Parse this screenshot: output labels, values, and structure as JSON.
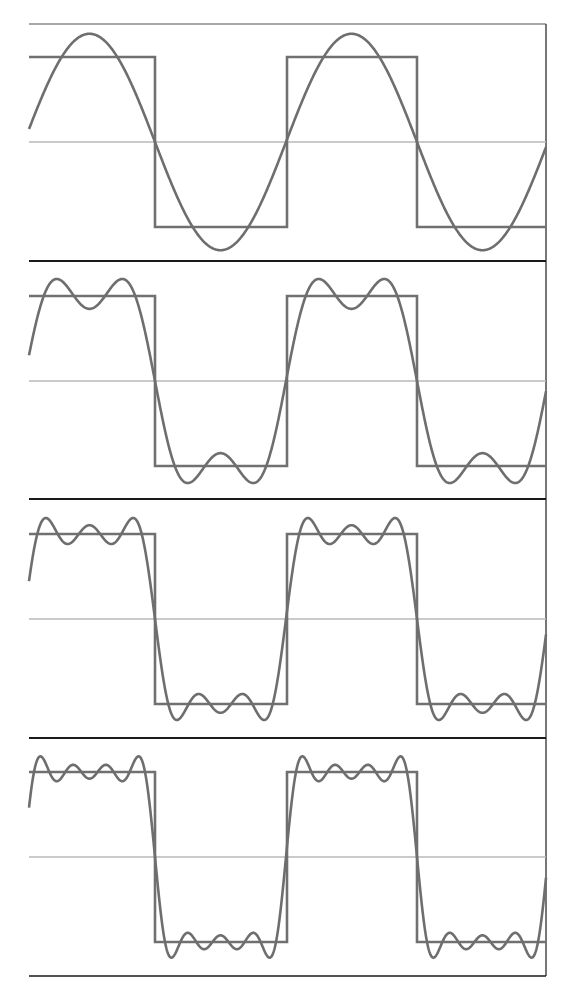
{
  "chart_data": {
    "type": "line",
    "title": "",
    "xlabel": "",
    "ylabel": "",
    "grid": false,
    "legend": null,
    "colors": {
      "square": "#707070",
      "approximation": "#6e6e6e",
      "midline": "#b8b8b8",
      "divider": "#1a1a1a",
      "frame": "#4a4a4a"
    },
    "layout": {
      "plot_left_px": 29,
      "plot_right_px": 546,
      "top_px": 24,
      "bottom_px": 976,
      "half_period_px": 131,
      "rising_zero_crossing_px": 24,
      "square_edges_px": [
        155,
        287,
        417
      ],
      "panel_bounds_px": [
        [
          24,
          261
        ],
        [
          261,
          499
        ],
        [
          499,
          738
        ],
        [
          738,
          976
        ]
      ],
      "panel_midlines_px": [
        142,
        381,
        619,
        857
      ],
      "square_half_height_px": 85
    },
    "x_range_periods": [
      0.0,
      1.97
    ],
    "y_range": [
      -1.4,
      1.4
    ],
    "square_wave": {
      "amplitude": 1,
      "period_px": 262,
      "levels": [
        1,
        -1
      ]
    },
    "panels": [
      {
        "label": "1 term",
        "harmonics": [
          1
        ],
        "formula": "(4/π)·sin(x)"
      },
      {
        "label": "2 terms",
        "harmonics": [
          1,
          3
        ],
        "formula": "(4/π)·[sin(x) + sin(3x)/3]"
      },
      {
        "label": "3 terms",
        "harmonics": [
          1,
          3,
          5
        ],
        "formula": "(4/π)·[sin(x) + sin(3x)/3 + sin(5x)/5]"
      },
      {
        "label": "4 terms",
        "harmonics": [
          1,
          3,
          5,
          7
        ],
        "formula": "(4/π)·[sin(x) + sin(3x)/3 + sin(5x)/5 + sin(7x)/7]"
      }
    ],
    "series": [
      {
        "name": "square wave",
        "values_description": "+1 on [0, π), −1 on [π, 2π), repeated"
      },
      {
        "name": "partial sum (1 harmonic)",
        "peak": 1.27
      },
      {
        "name": "partial sum (2 harmonics)",
        "peak": 1.2
      },
      {
        "name": "partial sum (3 harmonics)",
        "peak": 1.18
      },
      {
        "name": "partial sum (4 harmonics)",
        "peak": 1.17
      }
    ]
  }
}
